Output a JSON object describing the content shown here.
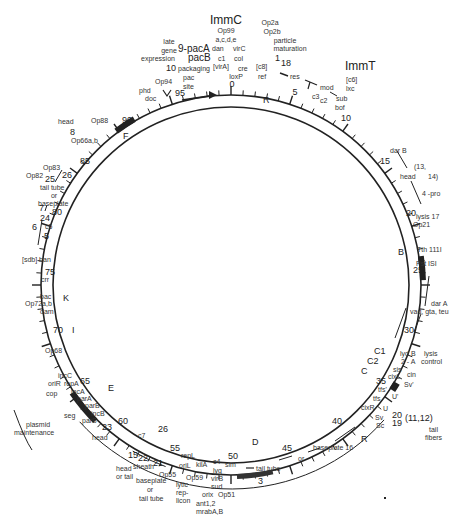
{
  "figure": {
    "type": "circular genetic map",
    "center": [
      231,
      285
    ],
    "outer_radius": 190,
    "inner_radius": 178,
    "scale_max": 100
  },
  "scale_ticks": {
    "major_labels": [
      "0",
      "5",
      "10",
      "15",
      "20",
      "25",
      "30",
      "35",
      "40",
      "45",
      "50",
      "55",
      "60",
      "65",
      "70",
      "75",
      "80",
      "85",
      "90",
      "95"
    ]
  },
  "immunity_regions": {
    "immC": "ImmC",
    "immT": "ImmT",
    "pac_a": "9-pacA",
    "pac_b": "pacB"
  },
  "inversion_markers": [
    "R",
    "B",
    "C1",
    "C2",
    "C",
    "E",
    "K",
    "I",
    "F",
    "D",
    "R"
  ],
  "labels_top": {
    "op99": "Op99",
    "acde": "a,c,d,e",
    "dan": "dan",
    "virC": "virC",
    "c1": "c1",
    "col": "col",
    "virA": "[virA]",
    "cre": "cre",
    "c8": "[c8]",
    "loxP": "loxP",
    "ref": "ref",
    "zero": "0",
    "op2a": "Op2a",
    "op2b": "Op2b",
    "particle": "particle",
    "maturation": "maturation",
    "one": "1",
    "eighteen": "18",
    "late": "late",
    "gene": "gene",
    "expression": "expression",
    "ten": "10",
    "packaging": "packaging",
    "pac": "pac",
    "site": "site",
    "op94": "Op94",
    "phd": "phd",
    "doc": "doc"
  },
  "labels_right": {
    "res": "res",
    "mod": "mod",
    "c3": "c3",
    "c2": "c2",
    "c6": "[c6]",
    "lxc": "lxc",
    "sub": "sub",
    "bof": "bof",
    "darB": "dar B",
    "thirteen_fourteen_a": "(13,",
    "thirteen_fourteen_b": "14)",
    "head": "head",
    "four_pro": "4 -pro",
    "lysis17": "lysis 17",
    "op21": "Op21",
    "tth": "Tth 111I",
    "pst": "Pst ISI",
    "darA": "dar A",
    "vad": "vad, gta, teu",
    "lydB": "lyd B",
    "twoA": "2 - A",
    "lysis": "lysis",
    "control": "control",
    "sis": "sis",
    "cixL": "cixL",
    "cin": "cin",
    "sv_prime": "Sv'",
    "tfs_prime": "tfs'",
    "u_prime": "U'",
    "tfs": "tfs",
    "cixR": "cixR",
    "u": "U",
    "sv": "Sv",
    "sc": "Sc",
    "twenty": "20",
    "nineteen": "19",
    "eleven_twelve": "(11,12)",
    "tail": "tail",
    "fibers": "fibers"
  },
  "labels_bottom": {
    "baseplate16": "baseplate  16",
    "or": "or",
    "tailtube": "tail tube",
    "three": "3",
    "c4": "c4",
    "lyg": "lyg",
    "virB": "virB",
    "sud": "sud",
    "orix": "orix",
    "op51": "Op51",
    "ant": "ant1,2",
    "mrab": "mrabA,B",
    "sim": "sim",
    "repL": "repL",
    "oriL": "oriL",
    "kilA": "kilA",
    "op59": "Op59",
    "lytic": "lytic",
    "rep": "rep-",
    "licon": "licon",
    "op55": "Op55",
    "twentyone": "21",
    "twentytwo": "22",
    "sheath": "sheath",
    "fifteen": "15",
    "headortail_1": "head",
    "headortail_2": "or tail",
    "baseplate": "baseplate",
    "or2": "or",
    "tailtube2": "tail tube",
    "c7": "c7",
    "twentysix": "26",
    "twentythree": "23",
    "head": "head"
  },
  "labels_left": {
    "head": "head",
    "eight": "8",
    "op88": "Op88",
    "op66": "Op66a,b",
    "op83": "Op83",
    "op82": "Op82",
    "twentyfive": "25",
    "twentysix": "26",
    "tailtube": "tail tube",
    "or": "or",
    "baseplate": "baseplate",
    "seven": "7",
    "twentyfour": "24",
    "six": "6",
    "c5": "c5",
    "five": "5",
    "sdb": "[sdb] ban",
    "crr": "crr",
    "bac": "bac",
    "op72": "Op72a,b",
    "dam": "dam",
    "op68": "Op68",
    "incC": "incC",
    "oriR": "oriR",
    "repA": "repA",
    "incA": "incA",
    "cop": "cop",
    "parA": "parA",
    "parB": "parB",
    "incB": "incB",
    "seg": "seg",
    "parS": "parS",
    "plasmid": "plasmid",
    "maintenance": "maintenance"
  }
}
